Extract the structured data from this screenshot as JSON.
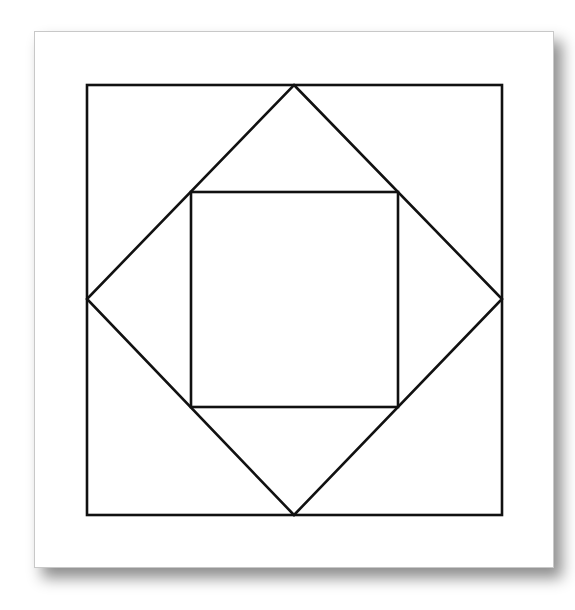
{
  "figure": {
    "type": "nested-squares-diagram",
    "card": {
      "x": 34,
      "y": 31,
      "width": 520,
      "height": 537
    },
    "outer_square": {
      "x1": 87,
      "y1": 85,
      "x2": 502,
      "y2": 515
    },
    "diamond": {
      "top": [
        294,
        85
      ],
      "right": [
        502,
        299
      ],
      "bottom": [
        294,
        515
      ],
      "left": [
        87,
        299
      ]
    },
    "inner_square": {
      "x1": 191,
      "y1": 192,
      "x2": 398,
      "y2": 407
    },
    "stroke_color": "#111111",
    "stroke_width": 2.6
  }
}
